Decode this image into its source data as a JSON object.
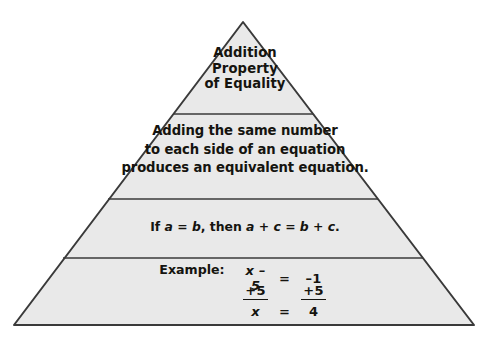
{
  "diagram": {
    "type": "pyramid",
    "title": "Addition Property of Equality",
    "colors": {
      "fill": "#e9e9e9",
      "stroke": "#3a3a3a",
      "background": "#ffffff",
      "text": "#15140f"
    },
    "geometry": {
      "apex_x": 243,
      "apex_y": 22,
      "base_left_x": 14,
      "base_right_x": 474,
      "base_y": 325,
      "divider_y": [
        114,
        199,
        258
      ]
    },
    "tiers": [
      {
        "name": "title",
        "lines": [
          "Addition",
          "Property",
          "of Equality"
        ]
      },
      {
        "name": "statement",
        "lines": [
          "Adding the same number",
          "to each side of an equation",
          "produces an equivalent equation."
        ]
      },
      {
        "name": "symbolic",
        "prefix": "If ",
        "a1": "a",
        "eq1": " = ",
        "b1": "b",
        "then": ", then ",
        "a2": "a",
        "plus1": " + ",
        "c1": "c",
        "eq2": " = ",
        "b2": "b",
        "plus2": " + ",
        "c2": "c",
        "period": "."
      },
      {
        "name": "example",
        "label": "Example:",
        "row1": {
          "lhs": "x – 5",
          "eq": "=",
          "rhs": "–1"
        },
        "row2": {
          "lhs": "+5",
          "eq": "",
          "rhs": "+5"
        },
        "row3": {
          "lhs": "x",
          "eq": "=",
          "rhs": "4"
        }
      }
    ]
  }
}
